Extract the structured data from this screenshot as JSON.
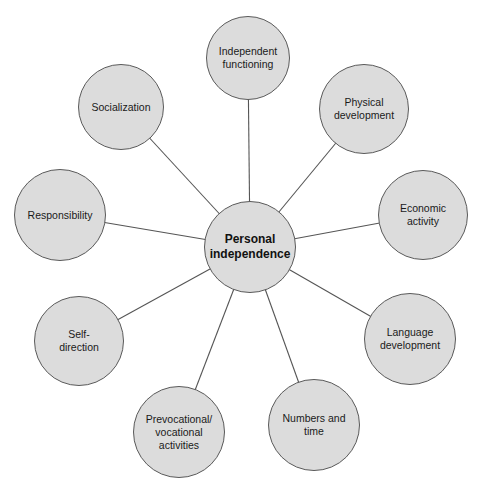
{
  "diagram": {
    "type": "hub-and-spoke",
    "colors": {
      "node_fill": "#dcdcdc",
      "node_border": "#5a5a5a",
      "line": "#555555",
      "text": "#1a1a1a"
    },
    "center": {
      "label": "Personal\nindependence",
      "cx": 250,
      "cy": 247,
      "r": 46
    },
    "nodes": [
      {
        "id": "independent-functioning",
        "label": "Independent\nfunctioning",
        "cx": 248,
        "cy": 58,
        "r": 42
      },
      {
        "id": "physical-development",
        "label": "Physical\ndevelopment",
        "cx": 364,
        "cy": 109,
        "r": 45
      },
      {
        "id": "economic-activity",
        "label": "Economic\nactivity",
        "cx": 423,
        "cy": 215,
        "r": 45
      },
      {
        "id": "language-development",
        "label": "Language\ndevelopment",
        "cx": 410,
        "cy": 339,
        "r": 46
      },
      {
        "id": "numbers-and-time",
        "label": "Numbers and\ntime",
        "cx": 314,
        "cy": 425,
        "r": 46
      },
      {
        "id": "prevocational-vocational-activities",
        "label": "Prevocational/\nvocational\nactivities",
        "cx": 179,
        "cy": 432,
        "r": 46
      },
      {
        "id": "self-direction",
        "label": "Self-\ndirection",
        "cx": 79,
        "cy": 341,
        "r": 45
      },
      {
        "id": "responsibility",
        "label": "Responsibility",
        "cx": 60,
        "cy": 215,
        "r": 46
      },
      {
        "id": "socialization",
        "label": "Socialization",
        "cx": 121,
        "cy": 107,
        "r": 43
      }
    ]
  }
}
